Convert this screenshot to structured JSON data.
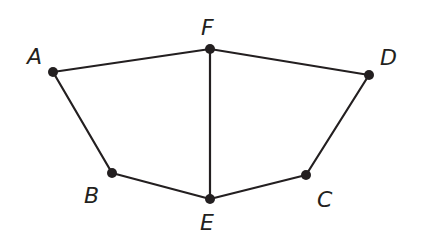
{
  "diagram": {
    "points": [
      {
        "name": "A",
        "x": 53,
        "y": 72,
        "lx": 28,
        "ly": 64
      },
      {
        "name": "F",
        "x": 210,
        "y": 49,
        "lx": 201,
        "ly": 34
      },
      {
        "name": "D",
        "x": 369,
        "y": 75,
        "lx": 380,
        "ly": 64
      },
      {
        "name": "B",
        "x": 112,
        "y": 173,
        "lx": 85,
        "ly": 202
      },
      {
        "name": "E",
        "x": 210,
        "y": 199,
        "lx": 200,
        "ly": 229
      },
      {
        "name": "C",
        "x": 306,
        "y": 175,
        "lx": 318,
        "ly": 207
      }
    ],
    "segments": [
      [
        "A",
        "F"
      ],
      [
        "F",
        "D"
      ],
      [
        "A",
        "B"
      ],
      [
        "B",
        "E"
      ],
      [
        "F",
        "E"
      ],
      [
        "E",
        "C"
      ],
      [
        "C",
        "D"
      ]
    ],
    "labels": {
      "A": "A",
      "B": "B",
      "C": "C",
      "D": "D",
      "E": "E",
      "F": "F"
    }
  }
}
